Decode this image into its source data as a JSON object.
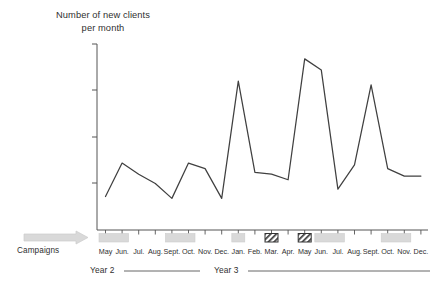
{
  "chart_data": {
    "type": "line",
    "title": "Number of new clients per month",
    "title_line1": "Number of new clients",
    "title_line2": "per month",
    "xlabel": "",
    "ylabel": "Number of new clients per month",
    "ylim": [
      0,
      100
    ],
    "grid": false,
    "legend_position": "none",
    "axis_tick_count_y": 5,
    "categories": [
      "May",
      "Jun.",
      "Jul.",
      "Aug.",
      "Sept.",
      "Oct.",
      "Nov.",
      "Dec.",
      "Jan.",
      "Feb.",
      "Mar.",
      "Apr.",
      "May",
      "Jun.",
      "Jul.",
      "Aug.",
      "Sept.",
      "Oct.",
      "Nov.",
      "Dec."
    ],
    "values": [
      18,
      36,
      30,
      25,
      17,
      36,
      33,
      17,
      80,
      31,
      30,
      27,
      92,
      86,
      22,
      35,
      78,
      33,
      29,
      29
    ],
    "series": [
      {
        "name": "New clients per month",
        "color": "#404040",
        "values": [
          18,
          36,
          30,
          25,
          17,
          36,
          33,
          17,
          80,
          31,
          30,
          27,
          92,
          86,
          22,
          35,
          78,
          33,
          29,
          29
        ]
      }
    ],
    "annotations": {
      "campaigns_label": "Campaigns",
      "year_labels": [
        "Year 2",
        "Year 3"
      ],
      "campaign_bars": [
        {
          "start_index": 0,
          "end_index": 1,
          "style": "solid-gray"
        },
        {
          "start_index": 4,
          "end_index": 5,
          "style": "solid-gray"
        },
        {
          "start_index": 8,
          "end_index": 8,
          "style": "solid-gray"
        },
        {
          "start_index": 10,
          "end_index": 10,
          "style": "hatched"
        },
        {
          "start_index": 12,
          "end_index": 12,
          "style": "hatched"
        },
        {
          "start_index": 13,
          "end_index": 14,
          "style": "solid-gray"
        },
        {
          "start_index": 17,
          "end_index": 18,
          "style": "solid-gray"
        }
      ]
    },
    "colors": {
      "line": "#404040",
      "axis": "#555555",
      "campaign_fill": "#d9d9d9",
      "campaign_hatch_border": "#333333",
      "text": "#2f2f2f",
      "background": "#ffffff"
    }
  },
  "months": {
    "m0": "May",
    "m1": "Jun.",
    "m2": "Jul.",
    "m3": "Aug.",
    "m4": "Sept.",
    "m5": "Oct.",
    "m6": "Nov.",
    "m7": "Dec.",
    "m8": "Jan.",
    "m9": "Feb.",
    "m10": "Mar.",
    "m11": "Apr.",
    "m12": "May",
    "m13": "Jun.",
    "m14": "Jul.",
    "m15": "Aug.",
    "m16": "Sept.",
    "m17": "Oct.",
    "m18": "Nov.",
    "m19": "Dec."
  },
  "labels": {
    "campaigns": "Campaigns",
    "year2": "Year 2",
    "year3": "Year 3",
    "title_line1": "Number of new clients",
    "title_line2": "per month"
  }
}
